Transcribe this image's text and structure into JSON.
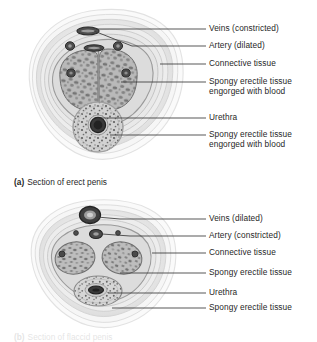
{
  "figure": {
    "background_color": "#ffffff",
    "text_color": "#1f1f1f",
    "leader_line_color": "#3a3a3a"
  },
  "panels": [
    {
      "id": "panel-a",
      "caption_tag": "(a)",
      "caption_text": "Section of erect penis",
      "state": "erect",
      "labels": [
        {
          "text": "Veins (constricted)",
          "line2": "",
          "label_x": 209,
          "label_y": 24,
          "leader_x1": 188,
          "leader_y1": 29,
          "leader_x2": 206,
          "leader_y2": 29,
          "target_x": 88,
          "target_y": 31
        },
        {
          "text": "Artery (dilated)",
          "line2": "",
          "label_x": 209,
          "label_y": 41,
          "leader_x1": 188,
          "leader_y1": 46,
          "leader_x2": 206,
          "leader_y2": 46,
          "target_x": 86,
          "target_y": 47
        },
        {
          "text": "Connective tissue",
          "line2": "",
          "label_x": 209,
          "label_y": 59,
          "leader_x1": 160,
          "leader_y1": 64,
          "leader_x2": 206,
          "leader_y2": 64,
          "target_x": 160,
          "target_y": 64
        },
        {
          "text": "Spongy erectile tissue",
          "line2": "engorged with blood",
          "label_x": 209,
          "label_y": 77,
          "leader_x1": 121,
          "leader_y1": 82,
          "leader_x2": 206,
          "leader_y2": 82,
          "target_x": 121,
          "target_y": 82
        },
        {
          "text": "Urethra",
          "line2": "",
          "label_x": 209,
          "label_y": 113,
          "leader_x1": 96,
          "leader_y1": 118,
          "leader_x2": 206,
          "leader_y2": 118,
          "target_x": 96,
          "target_y": 118
        },
        {
          "text": "Spongy erectile tissue",
          "line2": "engorged with blood",
          "label_x": 209,
          "label_y": 130,
          "leader_x1": 110,
          "leader_y1": 135,
          "leader_x2": 206,
          "leader_y2": 135,
          "target_x": 110,
          "target_y": 135
        }
      ]
    },
    {
      "id": "panel-b",
      "caption_tag": "(b)",
      "caption_text": "Section of flaccid penis",
      "state": "flaccid",
      "labels": [
        {
          "text": "Veins (dilated)",
          "line2": "",
          "label_x": 209,
          "label_y": 214,
          "leader_x1": 188,
          "leader_y1": 219,
          "leader_x2": 206,
          "leader_y2": 219,
          "target_x": 90,
          "target_y": 215
        },
        {
          "text": "Artery (constricted)",
          "line2": "",
          "label_x": 209,
          "label_y": 231,
          "leader_x1": 188,
          "leader_y1": 236,
          "leader_x2": 206,
          "leader_y2": 236,
          "target_x": 94,
          "target_y": 233
        },
        {
          "text": "Connective tissue",
          "line2": "",
          "label_x": 209,
          "label_y": 248,
          "leader_x1": 152,
          "leader_y1": 253,
          "leader_x2": 206,
          "leader_y2": 253,
          "target_x": 152,
          "target_y": 253
        },
        {
          "text": "Spongy erectile tissue",
          "line2": "",
          "label_x": 209,
          "label_y": 268,
          "leader_x1": 120,
          "leader_y1": 273,
          "leader_x2": 206,
          "leader_y2": 273,
          "target_x": 120,
          "target_y": 273
        },
        {
          "text": "Urethra",
          "line2": "",
          "label_x": 209,
          "label_y": 288,
          "leader_x1": 104,
          "leader_y1": 293,
          "leader_x2": 206,
          "leader_y2": 293,
          "target_x": 104,
          "target_y": 293
        },
        {
          "text": "Spongy erectile tissue",
          "line2": "",
          "label_x": 209,
          "label_y": 303,
          "leader_x1": 112,
          "leader_y1": 308,
          "leader_x2": 206,
          "leader_y2": 308,
          "target_x": 112,
          "target_y": 308
        }
      ]
    }
  ],
  "anatomy": {
    "structures": [
      "skin",
      "superficial fascia",
      "deep fascia",
      "connective tissue",
      "corpus cavernosum",
      "corpus spongiosum",
      "urethra",
      "deep artery",
      "dorsal vein",
      "dorsal artery"
    ]
  }
}
